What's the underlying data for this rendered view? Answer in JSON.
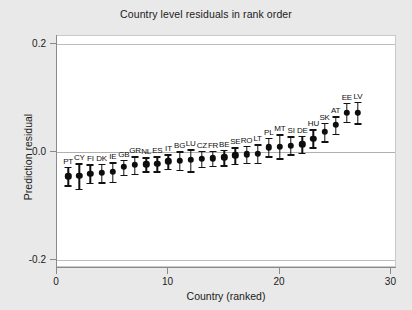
{
  "chart_data": {
    "type": "scatter",
    "title": "Country level residuals in rank order",
    "xlabel": "Country (ranked)",
    "ylabel": "Prediction residual",
    "xlim": [
      0,
      30.5
    ],
    "ylim": [
      -0.215,
      0.215
    ],
    "xticks": [
      0,
      10,
      20,
      30
    ],
    "yticks": [
      0.2,
      0.0,
      -0.2
    ],
    "ytick_labels": [
      "0.2",
      "0.0",
      "-0.2"
    ],
    "xtick_labels": [
      "0",
      "10",
      "20",
      "30"
    ],
    "grid": true,
    "gridlines_y": [
      0.2,
      0.0,
      -0.2
    ],
    "legend": null,
    "error_bars": true,
    "marker": "filled-circle",
    "points": [
      {
        "rank": 1,
        "label": "PT",
        "value": -0.045,
        "low": -0.062,
        "high": -0.028
      },
      {
        "rank": 2,
        "label": "CY",
        "value": -0.044,
        "low": -0.068,
        "high": -0.021
      },
      {
        "rank": 3,
        "label": "FI",
        "value": -0.04,
        "low": -0.057,
        "high": -0.023
      },
      {
        "rank": 4,
        "label": "DK",
        "value": -0.039,
        "low": -0.056,
        "high": -0.022
      },
      {
        "rank": 5,
        "label": "IE",
        "value": -0.037,
        "low": -0.055,
        "high": -0.019
      },
      {
        "rank": 6,
        "label": "GB",
        "value": -0.028,
        "low": -0.042,
        "high": -0.014
      },
      {
        "rank": 7,
        "label": "GR",
        "value": -0.024,
        "low": -0.04,
        "high": -0.008
      },
      {
        "rank": 8,
        "label": "NL",
        "value": -0.023,
        "low": -0.036,
        "high": -0.01
      },
      {
        "rank": 9,
        "label": "ES",
        "value": -0.022,
        "low": -0.036,
        "high": -0.008
      },
      {
        "rank": 10,
        "label": "IT",
        "value": -0.017,
        "low": -0.031,
        "high": -0.004
      },
      {
        "rank": 11,
        "label": "BG",
        "value": -0.016,
        "low": -0.033,
        "high": 0.001
      },
      {
        "rank": 12,
        "label": "LU",
        "value": -0.015,
        "low": -0.036,
        "high": 0.005
      },
      {
        "rank": 13,
        "label": "CZ",
        "value": -0.013,
        "low": -0.028,
        "high": 0.002
      },
      {
        "rank": 14,
        "label": "FR",
        "value": -0.012,
        "low": -0.026,
        "high": 0.002
      },
      {
        "rank": 15,
        "label": "BE",
        "value": -0.01,
        "low": -0.025,
        "high": 0.004
      },
      {
        "rank": 16,
        "label": "SE",
        "value": -0.006,
        "low": -0.022,
        "high": 0.009
      },
      {
        "rank": 17,
        "label": "RO",
        "value": -0.004,
        "low": -0.02,
        "high": 0.011
      },
      {
        "rank": 18,
        "label": "LT",
        "value": -0.003,
        "low": -0.02,
        "high": 0.014
      },
      {
        "rank": 19,
        "label": "PL",
        "value": 0.009,
        "low": -0.008,
        "high": 0.026
      },
      {
        "rank": 20,
        "label": "MT",
        "value": 0.01,
        "low": -0.012,
        "high": 0.033
      },
      {
        "rank": 21,
        "label": "SI",
        "value": 0.012,
        "low": -0.004,
        "high": 0.029
      },
      {
        "rank": 22,
        "label": "DE",
        "value": 0.014,
        "low": -0.001,
        "high": 0.03
      },
      {
        "rank": 23,
        "label": "HU",
        "value": 0.025,
        "low": 0.009,
        "high": 0.042
      },
      {
        "rank": 24,
        "label": "SK",
        "value": 0.037,
        "low": 0.02,
        "high": 0.054
      },
      {
        "rank": 25,
        "label": "AT",
        "value": 0.05,
        "low": 0.034,
        "high": 0.066
      },
      {
        "rank": 26,
        "label": "EE",
        "value": 0.073,
        "low": 0.056,
        "high": 0.091
      },
      {
        "rank": 27,
        "label": "LV",
        "value": 0.073,
        "low": 0.053,
        "high": 0.093
      }
    ]
  }
}
